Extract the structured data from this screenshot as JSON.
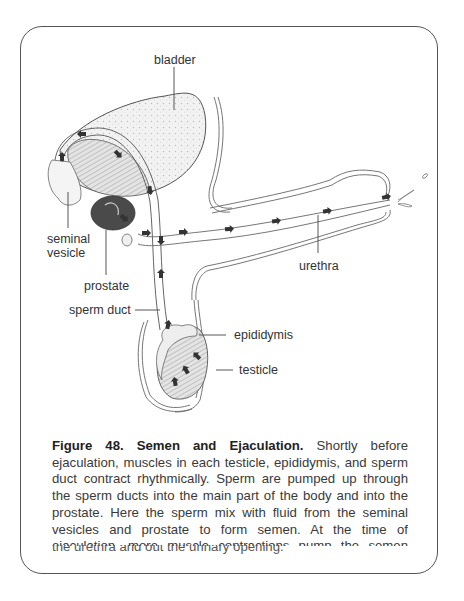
{
  "figure": {
    "labels": {
      "bladder": "bladder",
      "seminal_vesicle_line1": "seminal",
      "seminal_vesicle_line2": "vesicle",
      "prostate": "prostate",
      "sperm_duct": "sperm duct",
      "urethra": "urethra",
      "epididymis": "epididymis",
      "testicle": "testicle"
    },
    "caption": {
      "title": "Figure 48. Semen and Ejaculation.",
      "body": " Shortly before ejaculation, muscles in each testicle, epididymis, and sperm duct contract rhythmically. Sperm are pumped up through the sperm ducts into the main part of the body and into the prostate. Here the sperm mix with fluid from the seminal vesicles and prostate to form semen. At the time of ejaculation, more muscle contractions pump the semen through",
      "last_line": "the urethra and out the urinary opening."
    }
  },
  "colors": {
    "border": "#555555",
    "text": "#3a3a3a",
    "prostate_fill": "#4a4a4a",
    "arrow": "#333333"
  }
}
